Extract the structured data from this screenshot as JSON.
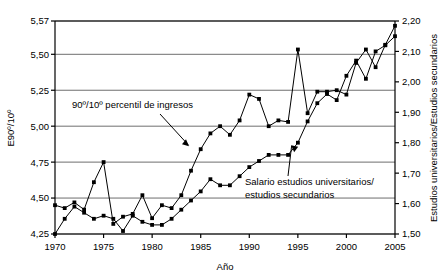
{
  "chart_data": {
    "type": "line",
    "title": "",
    "xlabel": "Año",
    "ylabel": "E90º/10º",
    "ylabel_right": "Estudios universitarios/Estudios secundarios",
    "grid": true,
    "legend_position": "inline-annotations",
    "xlim": [
      1970,
      2005
    ],
    "xticks": [
      "1970",
      "1975",
      "1980",
      "1985",
      "1990",
      "1995",
      "2000",
      "2005"
    ],
    "xtick_values": [
      1970,
      1975,
      1980,
      1985,
      1990,
      1995,
      2000,
      2005
    ],
    "ylim_left": [
      4.25,
      5.57
    ],
    "yticks_left": [
      "4,25",
      "4,50",
      "4,75",
      "5,00",
      "5,25",
      "5,50",
      "5,57"
    ],
    "ytick_values_left": [
      4.25,
      4.5,
      4.75,
      5.0,
      5.25,
      5.5,
      5.57
    ],
    "ylim_right": [
      1.5,
      2.2
    ],
    "yticks_right": [
      "1,50",
      "1,60",
      "1,70",
      "1,80",
      "1,90",
      "2,00",
      "2,10",
      "2,20"
    ],
    "ytick_values_right": [
      1.5,
      1.6,
      1.7,
      1.8,
      1.9,
      2.0,
      2.1,
      2.2
    ],
    "x": [
      1970,
      1971,
      1972,
      1973,
      1974,
      1975,
      1976,
      1977,
      1978,
      1979,
      1980,
      1981,
      1982,
      1983,
      1984,
      1985,
      1986,
      1987,
      1988,
      1989,
      1990,
      1991,
      1992,
      1993,
      1994,
      1995,
      1996,
      1997,
      1998,
      1999,
      2000,
      2001,
      2002,
      2003,
      2004,
      2005
    ],
    "series": [
      {
        "name": "90º/10º percentil de ingresos",
        "axis": "left",
        "marker": "square",
        "color": "#000000",
        "values": [
          4.45,
          4.43,
          4.47,
          4.42,
          4.61,
          4.75,
          4.32,
          4.37,
          4.39,
          4.52,
          4.36,
          4.45,
          4.43,
          4.52,
          4.69,
          4.84,
          4.95,
          5.0,
          4.94,
          5.04,
          5.22,
          5.19,
          5.0,
          5.04,
          5.03,
          5.51,
          5.09,
          5.24,
          5.24,
          5.25,
          5.22,
          5.44,
          5.51,
          5.41,
          5.52,
          5.56
        ]
      },
      {
        "name": "Salario estudios universitarios/estudios secundarios",
        "axis": "right",
        "marker": "square",
        "color": "#000000",
        "values": [
          1.5,
          1.55,
          1.59,
          1.57,
          1.55,
          1.56,
          1.55,
          1.51,
          1.56,
          1.54,
          1.53,
          1.53,
          1.55,
          1.58,
          1.61,
          1.64,
          1.68,
          1.66,
          1.66,
          1.69,
          1.72,
          1.74,
          1.76,
          1.76,
          1.76,
          1.8,
          1.87,
          1.93,
          1.96,
          1.94,
          2.02,
          2.07,
          2.01,
          2.1,
          2.12,
          2.15
        ]
      }
    ],
    "annotations": [
      {
        "text_line1": "90º/10º percentil de ingresos",
        "text_line2": "",
        "target_x": 1984,
        "target_y_left": 4.84
      },
      {
        "text_line1": "Salario estudios universitarios/",
        "text_line2": "estudios secundarios",
        "target_x": 1994,
        "target_y_right": 1.8
      }
    ]
  },
  "axes": {
    "left_title": "E90º/10º",
    "right_title": "Estudios universitarios/Estudios secundarios",
    "bottom_title": "Año"
  }
}
